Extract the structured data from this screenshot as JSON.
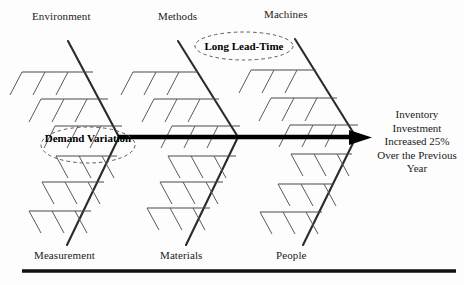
{
  "diagram": {
    "type": "fishbone-ishikawa",
    "title_visible": false,
    "background_color": "#fdfdfd",
    "line_color": "#2a2a2a",
    "spine_color": "#000000",
    "callout_color": "#555555"
  },
  "categories": {
    "top": [
      {
        "label": "Environment",
        "x": 32,
        "y": 10
      },
      {
        "label": "Methods",
        "x": 158,
        "y": 10
      },
      {
        "label": "Machines",
        "x": 264,
        "y": 8
      }
    ],
    "bottom": [
      {
        "label": "Measurement",
        "x": 34,
        "y": 249
      },
      {
        "label": "Materials",
        "x": 160,
        "y": 249
      },
      {
        "label": "People",
        "x": 276,
        "y": 249
      }
    ]
  },
  "callouts": [
    {
      "name": "long-lead-time",
      "lines": [
        "Long Lead-Time"
      ],
      "cx": 244,
      "cy": 46,
      "rx": 49,
      "ry": 14
    },
    {
      "name": "demand-variation",
      "lines": [
        "Demand",
        "Variation"
      ],
      "cx": 88,
      "cy": 145,
      "rx": 47,
      "ry": 18
    }
  ],
  "effect": {
    "lines": [
      "Inventory",
      "Investment",
      "Increased 25%",
      "Over the Previous",
      "Year"
    ]
  },
  "bones": [
    {
      "name": "bone-environment",
      "x1": 68,
      "y1": 41,
      "x2": 119,
      "y2": 137,
      "side": "top"
    },
    {
      "name": "bone-methods",
      "x1": 178,
      "y1": 41,
      "x2": 238,
      "y2": 137,
      "side": "top"
    },
    {
      "name": "bone-machines",
      "x1": 295,
      "y1": 39,
      "x2": 356,
      "y2": 137,
      "side": "top"
    },
    {
      "name": "bone-measurement",
      "x1": 119,
      "y1": 137,
      "x2": 67,
      "y2": 245,
      "side": "bottom"
    },
    {
      "name": "bone-materials",
      "x1": 238,
      "y1": 137,
      "x2": 186,
      "y2": 245,
      "side": "bottom"
    },
    {
      "name": "bone-people",
      "x1": 356,
      "y1": 137,
      "x2": 303,
      "y2": 245,
      "side": "bottom"
    }
  ],
  "spine": {
    "x1": 118,
    "y1": 137,
    "x2": 358,
    "y2": 137,
    "arrow_tip_x": 372
  },
  "bottom_rule": {
    "x1": 22,
    "y1": 271,
    "x2": 456,
    "y2": 271
  },
  "sub_bone_counts": {
    "per_bone": 3,
    "twigs_per_sub_bone": 3
  }
}
